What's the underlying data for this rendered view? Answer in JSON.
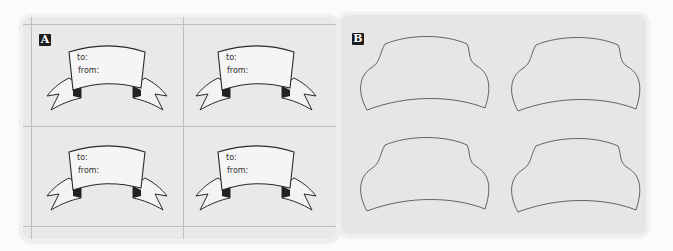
{
  "panels": [
    {
      "id": "A",
      "label": "A",
      "description": "Four banner gift tags on gridded sheet",
      "tags": [
        {
          "to_label": "to:",
          "from_label": "from:"
        },
        {
          "to_label": "to:",
          "from_label": "from:"
        },
        {
          "to_label": "to:",
          "from_label": "from:"
        },
        {
          "to_label": "to:",
          "from_label": "from:"
        }
      ]
    },
    {
      "id": "B",
      "label": "B",
      "description": "Four cut-out tag outlines"
    }
  ],
  "colors": {
    "panel_bg": "#e8e8e8",
    "stroke": "#333333",
    "label_bg": "#1d1d1d"
  }
}
